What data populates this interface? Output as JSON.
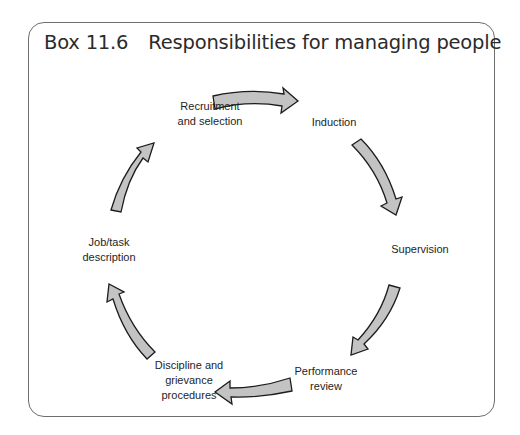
{
  "box": {
    "number": "Box 11.6",
    "title": "Responsibilities for managing people"
  },
  "cycle": {
    "nodes": [
      {
        "id": "recruitment",
        "lines": [
          "Recruitment",
          "and selection"
        ],
        "x": 210,
        "y": 114
      },
      {
        "id": "induction",
        "lines": [
          "Induction"
        ],
        "x": 334,
        "y": 122
      },
      {
        "id": "supervision",
        "lines": [
          "Supervision"
        ],
        "x": 420,
        "y": 249
      },
      {
        "id": "performance",
        "lines": [
          "Performance",
          "review"
        ],
        "x": 326,
        "y": 379
      },
      {
        "id": "discipline",
        "lines": [
          "Discipline and",
          "grievance",
          "procedures"
        ],
        "x": 189,
        "y": 380
      },
      {
        "id": "jobtask",
        "lines": [
          "Job/task",
          "description"
        ],
        "x": 109,
        "y": 250
      }
    ],
    "arrows": [
      {
        "from": "recruitment",
        "to": "induction"
      },
      {
        "from": "induction",
        "to": "supervision"
      },
      {
        "from": "supervision",
        "to": "performance"
      },
      {
        "from": "performance",
        "to": "discipline"
      },
      {
        "from": "discipline",
        "to": "jobtask"
      },
      {
        "from": "jobtask",
        "to": "recruitment"
      }
    ],
    "colors": {
      "arrow_fill": "#c3c3c3",
      "arrow_stroke": "#1c1c1c",
      "border": "#6e6e6e",
      "text": "#1e1e1e"
    }
  }
}
